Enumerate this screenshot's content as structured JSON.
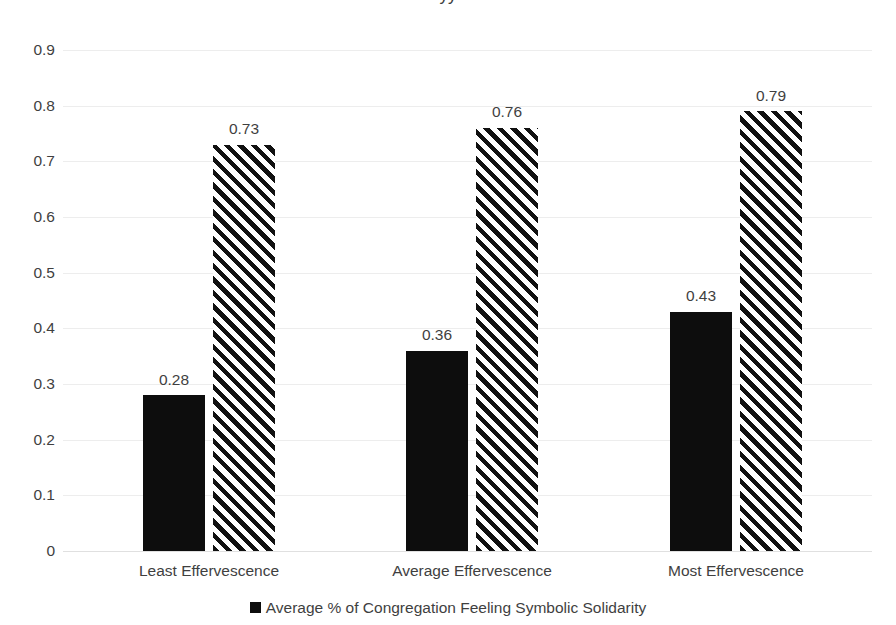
{
  "chart_data": {
    "type": "bar",
    "title": "",
    "title_partial_cutoff": "yy",
    "xlabel": "",
    "ylabel": "",
    "ylim": [
      0,
      0.9
    ],
    "grid": true,
    "legend_position": "bottom",
    "categories": [
      "Least Effervescence",
      "Average Effervescence",
      "Most Effervescence"
    ],
    "ytick_labels": [
      "0.9",
      "0.8",
      "0.7",
      "0.6",
      "0.5",
      "0.4",
      "0.3",
      "0.2",
      "0.1",
      "0"
    ],
    "ytick_values": [
      0.9,
      0.8,
      0.7,
      0.6,
      0.5,
      0.4,
      0.3,
      0.2,
      0.1,
      0
    ],
    "series": [
      {
        "name": "Average % of Congregation Feeling Symbolic Solidarity",
        "style": "solid-black",
        "color": "#0d0d0d",
        "values": [
          0.28,
          0.36,
          0.43
        ],
        "labels": [
          "0.28",
          "0.36",
          "0.43"
        ]
      },
      {
        "name": "",
        "style": "diagonal-hatch",
        "color": "#111111",
        "values": [
          0.73,
          0.76,
          0.79
        ],
        "labels": [
          "0.73",
          "0.76",
          "0.79"
        ]
      }
    ]
  },
  "legend": {
    "items": [
      {
        "marker": "square-black",
        "label": "Average % of Congregation Feeling Symbolic Solidarity"
      }
    ]
  },
  "colors": {
    "series_solid": "#0d0d0d",
    "series_hatch": "#111111",
    "gridline": "#ededed",
    "text": "#3f3f3f",
    "background": "#ffffff"
  }
}
